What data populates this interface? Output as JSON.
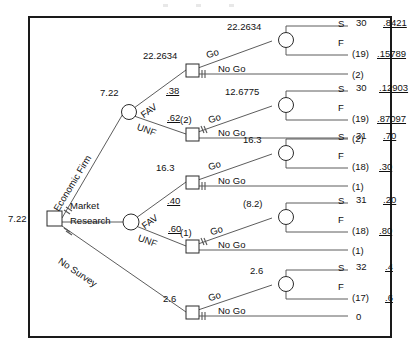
{
  "diagram": {
    "type": "decision-tree",
    "root": {
      "value": "7.22",
      "node_type": "decision-square"
    },
    "root_branches": [
      {
        "label_line1": "Economic",
        "label_line2": "Firm",
        "name": "economic-firm"
      },
      {
        "label_line1": "Market",
        "label_line2": "Research",
        "name": "market-research"
      },
      {
        "label_line1": "No",
        "label_line2": "Survey",
        "name": "no-survey"
      }
    ],
    "chance_nodes": [
      {
        "name": "upper-survey-outcome",
        "value": "7.22",
        "branches": [
          {
            "label": "FAV",
            "prob": ".38"
          },
          {
            "label": "UNF",
            "prob": ".62"
          }
        ]
      },
      {
        "name": "lower-survey-outcome",
        "value": "7.22",
        "branches": [
          {
            "label": "FAV",
            "prob": ".40"
          },
          {
            "label": "UNF",
            "prob": ".60"
          }
        ]
      }
    ],
    "decision_labels": {
      "go": "Go",
      "no_go": "No Go"
    },
    "outcome_labels": {
      "success": "S",
      "failure": "F"
    },
    "branches": [
      {
        "name": "fav-upper-go",
        "decision_value": "22.2634",
        "go_value": "22.2634",
        "no_go_value": "(2)",
        "pruned": "no-go",
        "outcomes": [
          {
            "label": "S",
            "payoff": "30",
            "prob": ".8421"
          },
          {
            "label": "F",
            "payoff": "(19)",
            "prob": ".15789"
          }
        ]
      },
      {
        "name": "unf-upper-go",
        "decision_value": "(2)",
        "go_value": "12.6775",
        "no_go_value": "(2)",
        "pruned": "go",
        "outcomes": [
          {
            "label": "S",
            "payoff": "30",
            "prob": ".12903"
          },
          {
            "label": "F",
            "payoff": "(19)",
            "prob": ".87097"
          }
        ]
      },
      {
        "name": "fav-lower-go",
        "decision_value": "16.3",
        "go_value": "16.3",
        "no_go_value": "(1)",
        "pruned": "no-go",
        "outcomes": [
          {
            "label": "S",
            "payoff": "31",
            "prob": ".70"
          },
          {
            "label": "F",
            "payoff": "(18)",
            "prob": ".30"
          }
        ]
      },
      {
        "name": "unf-lower-go",
        "decision_value": "(1)",
        "go_value": "(8.2)",
        "no_go_value": "(1)",
        "pruned": "go",
        "outcomes": [
          {
            "label": "S",
            "payoff": "31",
            "prob": ".20"
          },
          {
            "label": "F",
            "payoff": "(18)",
            "prob": ".80"
          }
        ]
      },
      {
        "name": "no-survey-go",
        "decision_value": "2.6",
        "go_value": "2.6",
        "no_go_value": "0",
        "pruned": "no-go",
        "outcomes": [
          {
            "label": "S",
            "payoff": "32",
            "prob": ".4"
          },
          {
            "label": "F",
            "payoff": "(17)",
            "prob": ".6"
          }
        ]
      }
    ]
  }
}
